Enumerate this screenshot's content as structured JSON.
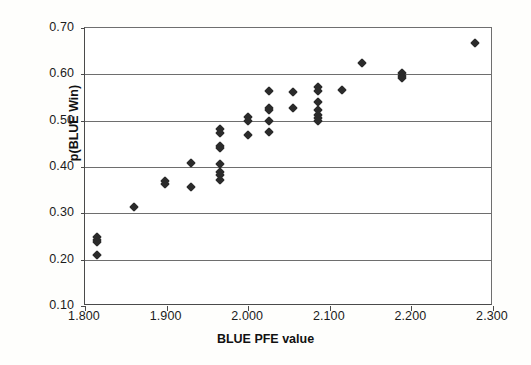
{
  "chart_data": {
    "type": "scatter",
    "title": "",
    "xlabel": "BLUE PFE value",
    "ylabel": "p(BLUE Win)",
    "xlim": [
      1.8,
      2.3
    ],
    "ylim": [
      0.1,
      0.7
    ],
    "xticks": [
      1.8,
      1.9,
      2.0,
      2.1,
      2.2,
      2.3
    ],
    "xtick_labels": [
      "1.800",
      "1.900",
      "2.000",
      "2.100",
      "2.200",
      "2.300"
    ],
    "yticks": [
      0.1,
      0.2,
      0.3,
      0.4,
      0.5,
      0.6,
      0.7
    ],
    "ytick_labels": [
      "0.10",
      "0.20",
      "0.30",
      "0.40",
      "0.50",
      "0.60",
      "0.70"
    ],
    "grid": "horizontal",
    "legend": "none",
    "marker": "diamond",
    "marker_color": "#2b2b2b",
    "points": [
      {
        "x": 1.815,
        "y": 0.249
      },
      {
        "x": 1.815,
        "y": 0.243
      },
      {
        "x": 1.815,
        "y": 0.238
      },
      {
        "x": 1.815,
        "y": 0.211
      },
      {
        "x": 1.86,
        "y": 0.314
      },
      {
        "x": 1.898,
        "y": 0.37
      },
      {
        "x": 1.898,
        "y": 0.363
      },
      {
        "x": 1.93,
        "y": 0.408
      },
      {
        "x": 1.93,
        "y": 0.357
      },
      {
        "x": 1.965,
        "y": 0.481
      },
      {
        "x": 1.965,
        "y": 0.473
      },
      {
        "x": 1.965,
        "y": 0.446
      },
      {
        "x": 1.965,
        "y": 0.44
      },
      {
        "x": 1.966,
        "y": 0.407
      },
      {
        "x": 1.966,
        "y": 0.389
      },
      {
        "x": 1.966,
        "y": 0.383
      },
      {
        "x": 1.966,
        "y": 0.371
      },
      {
        "x": 2.0,
        "y": 0.507
      },
      {
        "x": 2.0,
        "y": 0.5
      },
      {
        "x": 2.0,
        "y": 0.468
      },
      {
        "x": 2.025,
        "y": 0.565
      },
      {
        "x": 2.025,
        "y": 0.528
      },
      {
        "x": 2.025,
        "y": 0.522
      },
      {
        "x": 2.025,
        "y": 0.5
      },
      {
        "x": 2.025,
        "y": 0.475
      },
      {
        "x": 2.055,
        "y": 0.562
      },
      {
        "x": 2.055,
        "y": 0.528
      },
      {
        "x": 2.085,
        "y": 0.573
      },
      {
        "x": 2.085,
        "y": 0.565
      },
      {
        "x": 2.085,
        "y": 0.54
      },
      {
        "x": 2.085,
        "y": 0.522
      },
      {
        "x": 2.085,
        "y": 0.512
      },
      {
        "x": 2.085,
        "y": 0.505
      },
      {
        "x": 2.085,
        "y": 0.5
      },
      {
        "x": 2.115,
        "y": 0.567
      },
      {
        "x": 2.14,
        "y": 0.625
      },
      {
        "x": 2.188,
        "y": 0.603
      },
      {
        "x": 2.188,
        "y": 0.597
      },
      {
        "x": 2.188,
        "y": 0.592
      },
      {
        "x": 2.278,
        "y": 0.668
      }
    ]
  }
}
